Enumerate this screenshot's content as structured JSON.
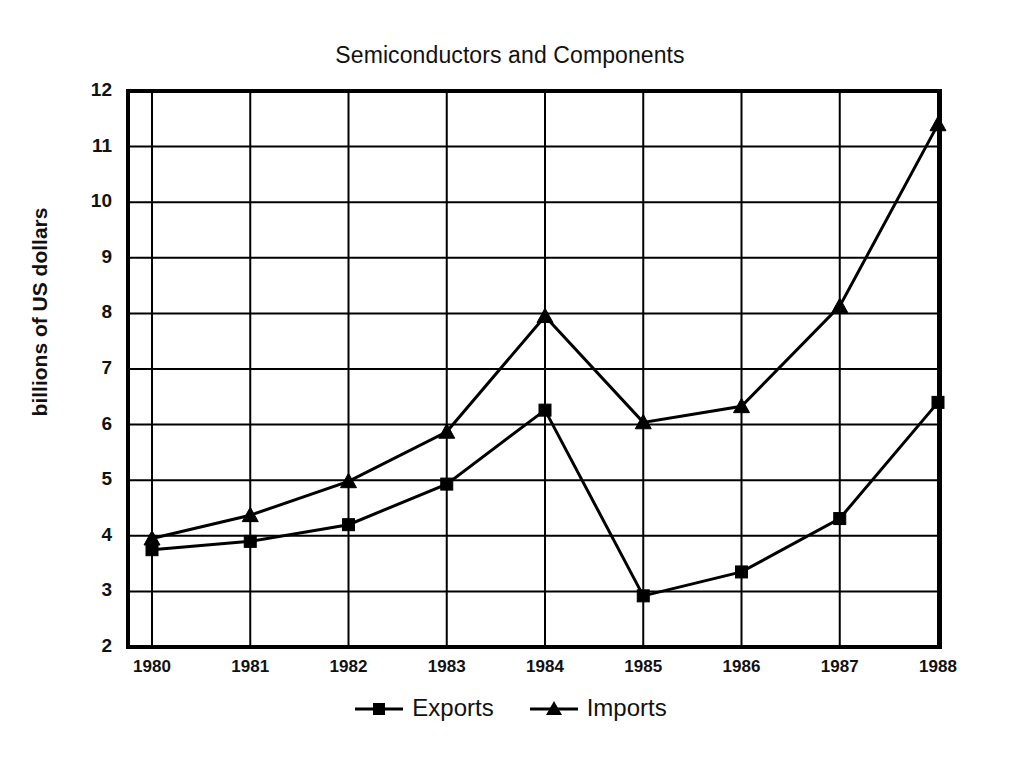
{
  "chart_data": {
    "type": "line",
    "title": "Semiconductors and Components",
    "xlabel": "",
    "ylabel": "billions of US dollars",
    "categories": [
      "1980",
      "1981",
      "1982",
      "1983",
      "1984",
      "1985",
      "1986",
      "1987",
      "1988"
    ],
    "x": [
      1980,
      1981,
      1982,
      1983,
      1984,
      1985,
      1986,
      1987,
      1988
    ],
    "series": [
      {
        "name": "Exports",
        "marker": "square",
        "color": "#000000",
        "values": [
          3.75,
          3.9,
          4.2,
          4.93,
          6.26,
          2.92,
          3.35,
          4.31,
          6.4
        ]
      },
      {
        "name": "Imports",
        "marker": "triangle",
        "color": "#000000",
        "values": [
          3.95,
          4.37,
          4.98,
          5.87,
          7.95,
          6.04,
          6.33,
          8.13,
          11.4
        ]
      }
    ],
    "ylim": [
      2,
      12
    ],
    "yticks": [
      2,
      3,
      4,
      5,
      6,
      7,
      8,
      9,
      10,
      11,
      12
    ],
    "ytick_labels": [
      "2",
      "3",
      "4",
      "5",
      "6",
      "7",
      "8",
      "9",
      "10",
      "11",
      "12"
    ],
    "xtick_labels": [
      "1980",
      "1981",
      "1982",
      "1983",
      "1984",
      "1985",
      "1986",
      "1987",
      "1988"
    ],
    "grid": true,
    "grid_color": "#000000",
    "legend_position": "bottom-center",
    "legend_entries": [
      "Exports",
      "Imports"
    ],
    "background": "#ffffff",
    "frame_color": "#000000"
  }
}
